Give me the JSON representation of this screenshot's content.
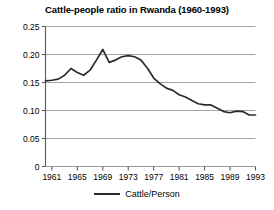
{
  "chart_data": {
    "type": "line",
    "title": "Cattle-people ratio in Rwanda (1960-1993)",
    "xlabel": "",
    "ylabel": "",
    "xlim": [
      1960,
      1993
    ],
    "ylim": [
      0,
      0.25
    ],
    "grid": true,
    "grid_axis": "y",
    "legend_position": "bottom-center",
    "yticks": [
      0,
      0.05,
      0.1,
      0.15,
      0.2,
      0.25
    ],
    "ytick_labels": [
      "0",
      "0.05",
      "0.10",
      "0.15",
      "0.20",
      "0.25"
    ],
    "xticks": [
      1961,
      1965,
      1969,
      1973,
      1977,
      1981,
      1985,
      1989,
      1993
    ],
    "xtick_labels": [
      "1961",
      "1965",
      "1969",
      "1973",
      "1977",
      "1981",
      "1985",
      "1989",
      "1993"
    ],
    "x": [
      1960,
      1961,
      1962,
      1963,
      1964,
      1965,
      1966,
      1967,
      1968,
      1969,
      1970,
      1971,
      1972,
      1973,
      1974,
      1975,
      1976,
      1977,
      1978,
      1979,
      1980,
      1981,
      1982,
      1983,
      1984,
      1985,
      1986,
      1987,
      1988,
      1989,
      1990,
      1991,
      1992,
      1993
    ],
    "series": [
      {
        "name": "Cattle/Person",
        "color": "#2b2b2b",
        "values": [
          0.153,
          0.154,
          0.156,
          0.163,
          0.175,
          0.168,
          0.163,
          0.172,
          0.19,
          0.209,
          0.186,
          0.19,
          0.196,
          0.198,
          0.196,
          0.19,
          0.176,
          0.158,
          0.148,
          0.14,
          0.136,
          0.128,
          0.124,
          0.118,
          0.112,
          0.11,
          0.11,
          0.104,
          0.098,
          0.096,
          0.099,
          0.098,
          0.092,
          0.092
        ]
      }
    ],
    "legend": [
      "Cattle/Person"
    ]
  },
  "legend": {
    "entry_label": "Cattle/Person",
    "swatch_name": "line-swatch"
  }
}
